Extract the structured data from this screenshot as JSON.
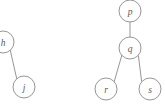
{
  "diagram": {
    "type": "tree-fragments",
    "background_color": "#ffffff",
    "stroke_color": "#8a8a8a",
    "label_color": "#5a5a5a",
    "node_radius": 11,
    "fragments": [
      {
        "id": "left-fragment",
        "nodes": [
          {
            "id": "h",
            "label": "h",
            "cx": 3,
            "cy": 42,
            "clipped": "left-edge"
          },
          {
            "id": "j",
            "label": "j",
            "cx": 24,
            "cy": 87,
            "clipped": "none"
          }
        ],
        "edges": [
          {
            "from": "h",
            "to": "j"
          }
        ]
      },
      {
        "id": "right-fragment",
        "nodes": [
          {
            "id": "p",
            "label": "p",
            "cx": 130,
            "cy": 11,
            "clipped": "none"
          },
          {
            "id": "q",
            "label": "q",
            "cx": 130,
            "cy": 48,
            "clipped": "none"
          },
          {
            "id": "r",
            "label": "r",
            "cx": 106,
            "cy": 89,
            "clipped": "none"
          },
          {
            "id": "s",
            "label": "s",
            "cx": 150,
            "cy": 89,
            "clipped": "none"
          }
        ],
        "edges": [
          {
            "from": "p",
            "to": "q"
          },
          {
            "from": "q",
            "to": "r"
          },
          {
            "from": "q",
            "to": "s"
          }
        ]
      }
    ]
  }
}
